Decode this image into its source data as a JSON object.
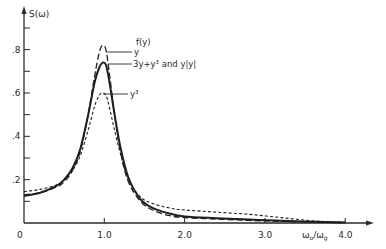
{
  "chart_data": {
    "type": "line",
    "title": "",
    "ylabel": "S(ω)",
    "xlabel": "ω₀/ω_g",
    "xlim": [
      0,
      4.4
    ],
    "ylim": [
      0,
      0.92
    ],
    "x_ticks": [
      {
        "value": 0,
        "label": "0"
      },
      {
        "value": 1.0,
        "label": "1.0"
      },
      {
        "value": 2.0,
        "label": "2.0"
      },
      {
        "value": 3.0,
        "label": "3.0"
      },
      {
        "value": 4.0,
        "label": "4.0"
      }
    ],
    "y_ticks": [
      {
        "value": 0.1,
        "label": ""
      },
      {
        "value": 0.2,
        "label": ".2"
      },
      {
        "value": 0.3,
        "label": ""
      },
      {
        "value": 0.4,
        "label": ".4"
      },
      {
        "value": 0.5,
        "label": ""
      },
      {
        "value": 0.6,
        "label": ".6"
      },
      {
        "value": 0.7,
        "label": ""
      },
      {
        "value": 0.8,
        "label": ".8"
      },
      {
        "value": 0.9,
        "label": ""
      }
    ],
    "legend_header": "f(y)",
    "grid": false,
    "series": [
      {
        "name": "y",
        "style": "long-dash",
        "x": [
          0,
          0.2,
          0.4,
          0.5,
          0.6,
          0.7,
          0.8,
          0.88,
          0.94,
          0.98,
          1.02,
          1.06,
          1.12,
          1.2,
          1.3,
          1.45,
          1.6,
          1.8,
          2.0,
          2.4,
          2.8,
          3.2,
          3.6,
          4.0
        ],
        "y": [
          0.13,
          0.14,
          0.165,
          0.19,
          0.24,
          0.33,
          0.5,
          0.68,
          0.79,
          0.82,
          0.8,
          0.7,
          0.52,
          0.33,
          0.19,
          0.1,
          0.06,
          0.035,
          0.025,
          0.018,
          0.012,
          0.008,
          0.005,
          0.002
        ]
      },
      {
        "name": "3y+y³ and y|y|",
        "style": "solid",
        "x": [
          0,
          0.2,
          0.4,
          0.5,
          0.6,
          0.7,
          0.8,
          0.88,
          0.94,
          0.98,
          1.02,
          1.06,
          1.12,
          1.2,
          1.3,
          1.45,
          1.6,
          1.8,
          2.0,
          2.4,
          2.8,
          3.2,
          3.6,
          4.0
        ],
        "y": [
          0.125,
          0.14,
          0.17,
          0.2,
          0.25,
          0.34,
          0.5,
          0.65,
          0.72,
          0.74,
          0.73,
          0.66,
          0.52,
          0.35,
          0.21,
          0.11,
          0.07,
          0.045,
          0.03,
          0.022,
          0.016,
          0.01,
          0.006,
          0.002
        ]
      },
      {
        "name": "y³",
        "style": "short-dash",
        "x": [
          0,
          0.2,
          0.4,
          0.5,
          0.6,
          0.7,
          0.8,
          0.88,
          0.94,
          0.98,
          1.02,
          1.06,
          1.12,
          1.2,
          1.3,
          1.45,
          1.6,
          1.8,
          2.0,
          2.4,
          2.8,
          3.2,
          3.6,
          4.0
        ],
        "y": [
          0.145,
          0.155,
          0.175,
          0.2,
          0.24,
          0.31,
          0.43,
          0.54,
          0.59,
          0.6,
          0.59,
          0.54,
          0.44,
          0.32,
          0.2,
          0.12,
          0.09,
          0.07,
          0.06,
          0.05,
          0.04,
          0.025,
          0.01,
          0.003
        ]
      }
    ],
    "legend_labels": [
      "y",
      "3y+y³ and y|y|",
      "y³"
    ]
  }
}
